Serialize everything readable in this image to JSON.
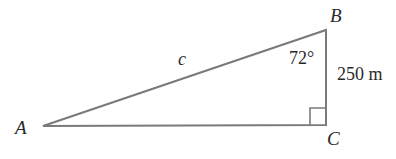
{
  "diagram": {
    "type": "right-triangle",
    "vertices": {
      "A": {
        "label": "A",
        "x": 43,
        "y": 126
      },
      "B": {
        "label": "B",
        "x": 326,
        "y": 30
      },
      "C": {
        "label": "C",
        "x": 326,
        "y": 125
      }
    },
    "labels": {
      "hypotenuse": "c",
      "angle_B": "72°",
      "side_BC": "250 m"
    },
    "right_angle_at": "C",
    "line_color": "#7a7a7a",
    "text_color": "#2a2a2a"
  }
}
